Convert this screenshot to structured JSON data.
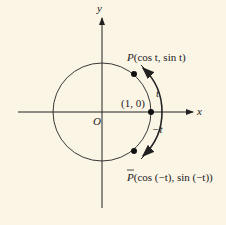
{
  "diagram": {
    "axes": {
      "x_label": "x",
      "y_label": "y",
      "origin_label": "O"
    },
    "points": {
      "p_label": "P(cos t, sin t)",
      "p_name": "P",
      "p_coords": "(cos t, sin t)",
      "pbar_name": "P",
      "pbar_coords": "(cos (−t), sin (−t))",
      "unit_label": "(1, 0)"
    },
    "arcs": {
      "upper_label": "t",
      "lower_label": "−t"
    },
    "colors": {
      "background": "#fbf5e6",
      "ink": "#222222"
    }
  }
}
